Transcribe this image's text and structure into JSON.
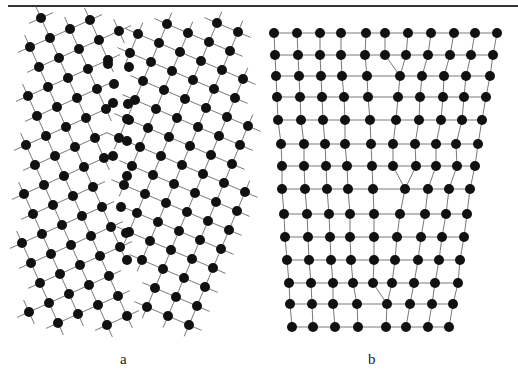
{
  "page": {
    "header_text": "",
    "labels": [
      {
        "text": "a",
        "x": 120,
        "y": 351
      },
      {
        "text": "b",
        "x": 368,
        "y": 351
      }
    ]
  },
  "figure": {
    "atom_radius": 5,
    "atom_color": "#111111",
    "bond_color": "#555555",
    "panel_a": {
      "description": "tilt grain boundary between two rotated square lattices",
      "grains": [
        {
          "name": "left-grain",
          "origin": [
            50,
            38
          ],
          "u": [
            20,
            -9
          ],
          "v": [
            9,
            20
          ],
          "i_range": [
            -6,
            8
          ],
          "j_range": [
            -2,
            16
          ],
          "side": "left"
        },
        {
          "name": "right-grain",
          "origin": [
            167,
            24
          ],
          "u": [
            21,
            9
          ],
          "v": [
            -8,
            19
          ],
          "i_range": [
            -8,
            6
          ],
          "j_range": [
            -1,
            17
          ],
          "side": "right"
        }
      ],
      "boundary": [
        [
          124,
          10
        ],
        [
          120,
          80
        ],
        [
          112,
          150
        ],
        [
          122,
          220
        ],
        [
          132,
          290
        ],
        [
          138,
          340
        ]
      ],
      "clip": {
        "xmin": 22,
        "xmax": 250,
        "ymin": 18,
        "ymax": 330
      },
      "core_atoms": [
        [
          108,
          64
        ],
        [
          129,
          67
        ],
        [
          114,
          84
        ],
        [
          113,
          103
        ],
        [
          128,
          104
        ],
        [
          129,
          120
        ],
        [
          127,
          141
        ],
        [
          113,
          156
        ],
        [
          127,
          176
        ],
        [
          121,
          207
        ],
        [
          126,
          233
        ],
        [
          127,
          260
        ]
      ]
    },
    "panel_b": {
      "description": "edge dislocations in a bent square lattice",
      "rows": [
        {
          "y": 33,
          "x": [
            274,
            297,
            320,
            341,
            366,
            385,
            408,
            431,
            454,
            475,
            497
          ]
        },
        {
          "y": 55,
          "x": [
            275,
            298,
            320,
            341,
            365,
            385,
            406,
            428,
            450,
            471,
            493
          ]
        },
        {
          "y": 76,
          "x": [
            276,
            299,
            321,
            342,
            367,
            400,
            422,
            444,
            466,
            490
          ]
        },
        {
          "y": 97,
          "x": [
            277,
            300,
            322,
            344,
            368,
            398,
            420,
            443,
            464,
            486
          ]
        },
        {
          "y": 120,
          "x": [
            278,
            301,
            323,
            345,
            370,
            396,
            419,
            441,
            462,
            482
          ]
        },
        {
          "y": 144,
          "x": [
            281,
            304,
            325,
            345,
            371,
            393,
            415,
            436,
            456,
            478
          ]
        },
        {
          "y": 166,
          "x": [
            282,
            304,
            326,
            347,
            372,
            393,
            416,
            436,
            457,
            475
          ]
        },
        {
          "y": 189,
          "x": [
            282,
            305,
            327,
            348,
            373,
            405,
            428,
            449,
            470
          ]
        },
        {
          "y": 214,
          "x": [
            284,
            307,
            329,
            350,
            374,
            400,
            425,
            446,
            467
          ]
        },
        {
          "y": 237,
          "x": [
            285,
            308,
            330,
            350,
            374,
            397,
            421,
            442,
            464
          ]
        },
        {
          "y": 260,
          "x": [
            287,
            309,
            331,
            351,
            374,
            395,
            418,
            439,
            460
          ]
        },
        {
          "y": 283,
          "x": [
            289,
            311,
            333,
            353,
            373,
            392,
            414,
            435,
            458
          ]
        },
        {
          "y": 304,
          "x": [
            290,
            312,
            333,
            357,
            387,
            410,
            432,
            453
          ]
        },
        {
          "y": 327,
          "x": [
            292,
            313,
            335,
            358,
            386,
            406,
            428,
            449
          ]
        }
      ]
    }
  }
}
